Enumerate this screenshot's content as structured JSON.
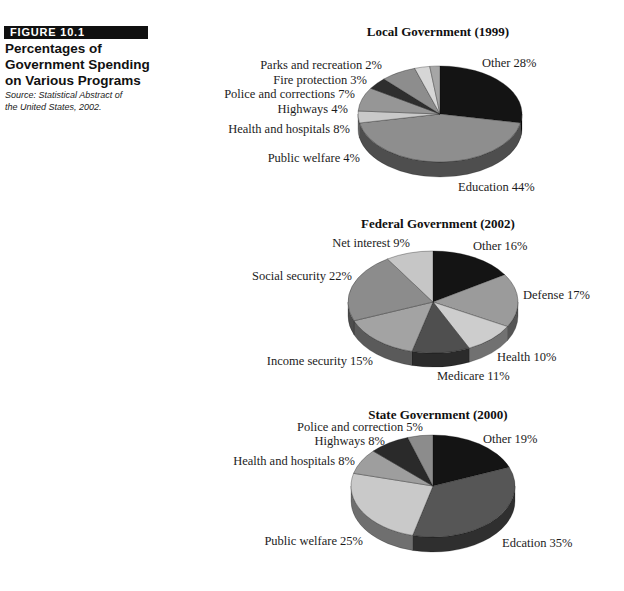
{
  "figure": {
    "tag": "FIGURE 10.1",
    "title_lines": [
      "Percentages of",
      "Government Spending",
      "on Various Programs"
    ],
    "source_lines": [
      "Source: Statistical Abstract of",
      "the United States, 2002."
    ]
  },
  "chart_data": [
    {
      "type": "pie",
      "title": "Local Government (1999)",
      "unit": "%",
      "start_angle_deg": 90,
      "direction": "clockwise",
      "geometry": {
        "cx": 440,
        "cy": 114,
        "rx": 82,
        "ry": 48,
        "depth": 15
      },
      "slices": [
        {
          "label": "Other",
          "value": 28,
          "label_text": "Other 28%",
          "color": "#141414"
        },
        {
          "label": "Education",
          "value": 44,
          "label_text": "Education 44%",
          "color": "#8e8e8e"
        },
        {
          "label": "Public welfare",
          "value": 4,
          "label_text": "Public welfare 4%",
          "color": "#c9c9c9"
        },
        {
          "label": "Health and hospitals",
          "value": 8,
          "label_text": "Health and hospitals 8%",
          "color": "#969696"
        },
        {
          "label": "Highways",
          "value": 4,
          "label_text": "Highways 4%",
          "color": "#2e2e2e"
        },
        {
          "label": "Police and corrections",
          "value": 7,
          "label_text": "Police and corrections 7%",
          "color": "#8d8d8d"
        },
        {
          "label": "Fire protection",
          "value": 3,
          "label_text": "Fire protection 3%",
          "color": "#d6d6d6"
        },
        {
          "label": "Parks and recreation",
          "value": 2,
          "label_text": "Parks and recreation 2%",
          "color": "#a6a6a6"
        }
      ]
    },
    {
      "type": "pie",
      "title": "Federal Government (2002)",
      "unit": "%",
      "start_angle_deg": 90,
      "direction": "clockwise",
      "geometry": {
        "cx": 433,
        "cy": 302,
        "rx": 85,
        "ry": 51,
        "depth": 14
      },
      "slices": [
        {
          "label": "Other",
          "value": 16,
          "label_text": "Other 16%",
          "color": "#141414"
        },
        {
          "label": "Defense",
          "value": 17,
          "label_text": "Defense 17%",
          "color": "#9b9b9b"
        },
        {
          "label": "Health",
          "value": 10,
          "label_text": "Health 10%",
          "color": "#cdcdcd"
        },
        {
          "label": "Medicare",
          "value": 11,
          "label_text": "Medicare 11%",
          "color": "#4f4f4f"
        },
        {
          "label": "Income security",
          "value": 15,
          "label_text": "Income security 15%",
          "color": "#a3a3a3"
        },
        {
          "label": "Social security",
          "value": 22,
          "label_text": "Social security 22%",
          "color": "#8c8c8c"
        },
        {
          "label": "Net interest",
          "value": 9,
          "label_text": "Net interest 9%",
          "color": "#c6c6c6"
        }
      ]
    },
    {
      "type": "pie",
      "title": "State Government (2000)",
      "unit": "%",
      "start_angle_deg": 90,
      "direction": "clockwise",
      "geometry": {
        "cx": 433,
        "cy": 486,
        "rx": 82,
        "ry": 51,
        "depth": 15
      },
      "slices": [
        {
          "label": "Other",
          "value": 19,
          "label_text": "Other 19%",
          "color": "#141414"
        },
        {
          "label": "Edcation",
          "value": 35,
          "label_text": "Edcation 35%",
          "color": "#565656"
        },
        {
          "label": "Public welfare",
          "value": 25,
          "label_text": "Public welfare 25%",
          "color": "#c9c9c9"
        },
        {
          "label": "Health and hospitals",
          "value": 8,
          "label_text": "Health and hospitals 8%",
          "color": "#9e9e9e"
        },
        {
          "label": "Highways",
          "value": 8,
          "label_text": "Highways 8%",
          "color": "#2a2a2a"
        },
        {
          "label": "Police and correction",
          "value": 5,
          "label_text": "Police and correction 5%",
          "color": "#8c8c8c"
        }
      ]
    }
  ]
}
